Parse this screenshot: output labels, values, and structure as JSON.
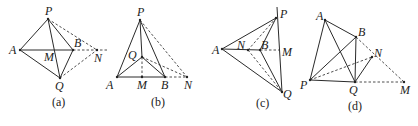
{
  "figures": [
    {
      "id": "a",
      "caption": "(a)",
      "points": {
        "P": "P",
        "A": "A",
        "B": "B",
        "M": "M",
        "N": "N",
        "Q": "Q"
      }
    },
    {
      "id": "b",
      "caption": "(b)",
      "points": {
        "P": "P",
        "Q": "Q",
        "A": "A",
        "M": "M",
        "B": "B",
        "N": "N"
      }
    },
    {
      "id": "c",
      "caption": "(c)",
      "points": {
        "P": "P",
        "A": "A",
        "N": "N",
        "B": "B",
        "M": "M",
        "Q": "Q"
      }
    },
    {
      "id": "d",
      "caption": "(d)",
      "points": {
        "A": "A",
        "B": "B",
        "N": "N",
        "P": "P",
        "Q": "Q",
        "M": "M"
      }
    }
  ]
}
